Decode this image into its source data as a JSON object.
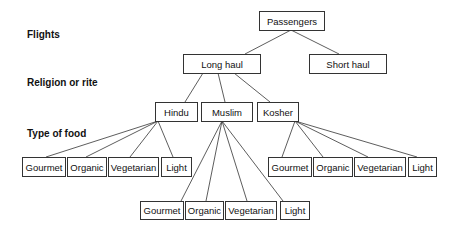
{
  "level_labels": {
    "flights": "Flights",
    "religion": "Religion or rite",
    "food": "Type of food"
  },
  "nodes": {
    "root": "Passengers",
    "long_haul": "Long haul",
    "short_haul": "Short haul",
    "hindu": "Hindu",
    "muslim": "Muslim",
    "kosher": "Kosher",
    "hindu_foods": [
      "Gourmet",
      "Organic",
      "Vegetarian",
      "Light"
    ],
    "muslim_foods": [
      "Gourmet",
      "Organic",
      "Vegetarian",
      "Light"
    ],
    "kosher_foods": [
      "Gourmet",
      "Organic",
      "Vegetarian",
      "Light"
    ]
  },
  "colors": {
    "line": "#333333",
    "text": "#111111",
    "background": "#ffffff"
  }
}
